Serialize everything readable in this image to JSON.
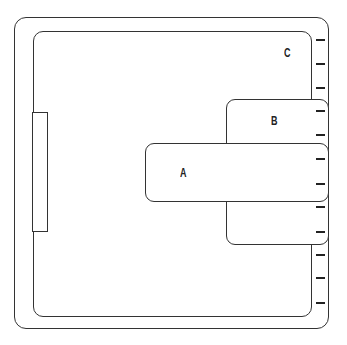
{
  "diagram": {
    "labels": {
      "a": "A",
      "b": "B",
      "c": "C"
    },
    "tick_count": 12
  }
}
